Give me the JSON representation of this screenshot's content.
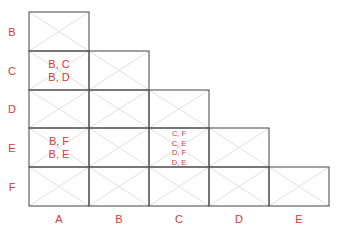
{
  "diagram": {
    "type": "lower-triangular pair matrix",
    "row_labels": [
      "B",
      "C",
      "D",
      "E",
      "F"
    ],
    "col_labels": [
      "A",
      "B",
      "C",
      "D",
      "E"
    ],
    "colors": {
      "label": "#d9363a",
      "grid": "#555555",
      "diagonal": "#d8d8d8"
    },
    "cells": {
      "C_A": [
        "B, C",
        "B, D"
      ],
      "E_A": [
        "B, F",
        "B, E"
      ],
      "E_C": [
        "C, F",
        "C, E",
        "D, F",
        "D, E"
      ]
    }
  }
}
